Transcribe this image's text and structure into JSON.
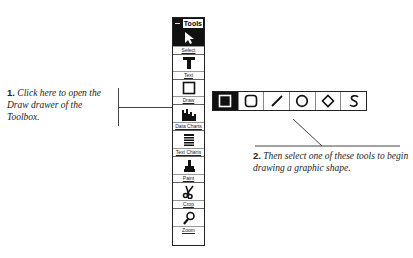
{
  "toolbox": {
    "title": "Tools",
    "tools": [
      {
        "label": "Select",
        "icon": "arrow-pointer-icon"
      },
      {
        "label": "Text",
        "icon": "text-t-icon"
      },
      {
        "label": "Draw",
        "icon": "square-outline-icon"
      },
      {
        "label": "Data Charts",
        "icon": "bar-chart-icon"
      },
      {
        "label": "Text Charts",
        "icon": "list-lines-icon"
      },
      {
        "label": "Paint",
        "icon": "paint-brush-icon"
      },
      {
        "label": "Crop",
        "icon": "scissors-icon"
      },
      {
        "label": "Zoom",
        "icon": "magnifier-icon"
      }
    ]
  },
  "draw_drawer": {
    "tools": [
      {
        "name": "rectangle",
        "icon": "rectangle-icon",
        "selected": true
      },
      {
        "name": "rounded-rectangle",
        "icon": "rounded-rectangle-icon",
        "selected": false
      },
      {
        "name": "line",
        "icon": "line-icon",
        "selected": false
      },
      {
        "name": "ellipse",
        "icon": "ellipse-icon",
        "selected": false
      },
      {
        "name": "diamond",
        "icon": "diamond-icon",
        "selected": false
      },
      {
        "name": "freeform",
        "icon": "freeform-s-icon",
        "selected": false
      }
    ]
  },
  "callouts": {
    "step1_num": "1.",
    "step1_text": "Click here to open the Draw drawer of the Toolbox.",
    "step2_num": "2.",
    "step2_text": "Then select one of these tools to begin drawing a graphic shape."
  }
}
